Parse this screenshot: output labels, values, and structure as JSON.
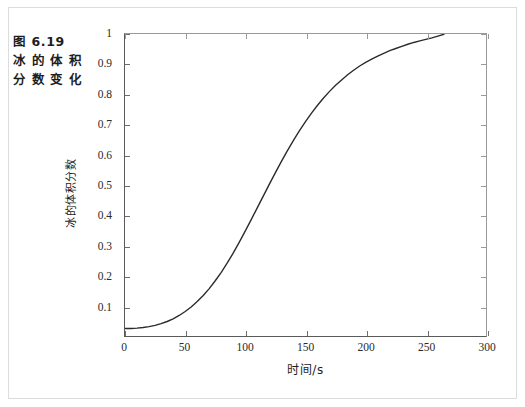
{
  "figure": {
    "caption_lines": [
      "图 6.19",
      "冰 的 体 积",
      "分 数 变 化"
    ]
  },
  "chart_data": {
    "type": "line",
    "title": "",
    "xlabel": "时间/s",
    "ylabel": "冰的体积分数",
    "xlim": [
      0,
      300
    ],
    "ylim": [
      0,
      1
    ],
    "grid": false,
    "legend": "none",
    "line_color": "#2b2b2b",
    "xticks": [
      0,
      50,
      100,
      150,
      200,
      250,
      300
    ],
    "xtick_labels": [
      "0",
      "50",
      "100",
      "150",
      "200",
      "250",
      "300"
    ],
    "yticks": [
      0.1,
      0.2,
      0.3,
      0.4,
      0.5,
      0.6,
      0.7,
      0.8,
      0.9,
      1
    ],
    "ytick_labels": [
      "0.1",
      "0.2",
      "0.3",
      "0.4",
      "0.5",
      "0.6",
      "0.7",
      "0.8",
      "0.9",
      "1"
    ],
    "series": [
      {
        "name": "冰的体积分数",
        "x": [
          0,
          5,
          10,
          15,
          20,
          25,
          30,
          35,
          40,
          45,
          50,
          55,
          60,
          65,
          70,
          75,
          80,
          85,
          90,
          95,
          100,
          105,
          110,
          115,
          120,
          125,
          130,
          135,
          140,
          145,
          150,
          155,
          160,
          165,
          170,
          175,
          180,
          185,
          190,
          195,
          200,
          205,
          210,
          215,
          220,
          225,
          230,
          235,
          240,
          245,
          250,
          255,
          260,
          265
        ],
        "y": [
          0.025,
          0.025,
          0.026,
          0.028,
          0.031,
          0.035,
          0.041,
          0.048,
          0.057,
          0.068,
          0.081,
          0.096,
          0.114,
          0.134,
          0.157,
          0.183,
          0.211,
          0.242,
          0.275,
          0.311,
          0.348,
          0.386,
          0.425,
          0.464,
          0.503,
          0.541,
          0.578,
          0.614,
          0.648,
          0.68,
          0.71,
          0.738,
          0.764,
          0.788,
          0.81,
          0.83,
          0.848,
          0.865,
          0.88,
          0.894,
          0.906,
          0.917,
          0.927,
          0.936,
          0.945,
          0.952,
          0.959,
          0.966,
          0.972,
          0.977,
          0.982,
          0.987,
          0.993,
          0.999
        ]
      }
    ]
  }
}
